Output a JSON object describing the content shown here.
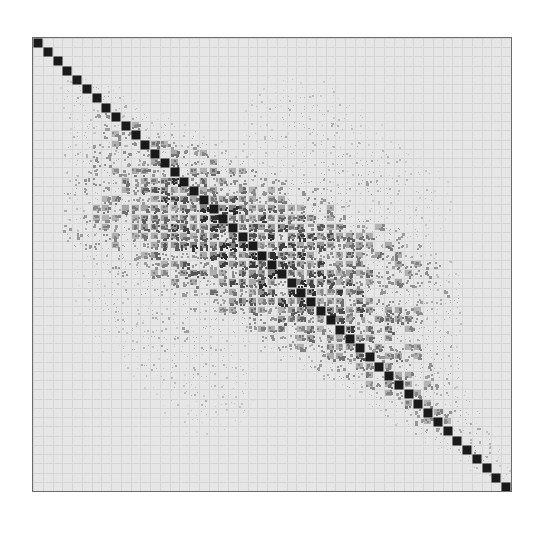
{
  "figure": {
    "title": "",
    "background_color": "#ffffff",
    "plot_background_color": "#e6e6e6",
    "frame_color": "#6b6b6b",
    "cell_dark_color": "#1a1a1a",
    "cell_mid_color": "#777777",
    "cell_light_color": "#b8b8b8",
    "gridline_color": "#d6d6d6"
  },
  "chart_data": {
    "type": "heatmap",
    "title": "",
    "xlabel": "",
    "ylabel": "",
    "grid": true,
    "legend": "none",
    "rows": 49,
    "cols": 49,
    "xticklabels": [],
    "yticklabels": [],
    "value_range": [
      0,
      1
    ],
    "colormap": "grayscale-dark-high",
    "diagonal_value": 1.0,
    "band_profile": [
      {
        "row": 0,
        "half_width": 0,
        "intensity": 0.0
      },
      {
        "row": 1,
        "half_width": 0,
        "intensity": 0.0
      },
      {
        "row": 2,
        "half_width": 0,
        "intensity": 0.0
      },
      {
        "row": 3,
        "half_width": 0,
        "intensity": 0.0
      },
      {
        "row": 4,
        "half_width": 1,
        "intensity": 0.14
      },
      {
        "row": 5,
        "half_width": 3,
        "intensity": 0.2
      },
      {
        "row": 6,
        "half_width": 4,
        "intensity": 0.24
      },
      {
        "row": 7,
        "half_width": 4,
        "intensity": 0.26
      },
      {
        "row": 8,
        "half_width": 5,
        "intensity": 0.28
      },
      {
        "row": 9,
        "half_width": 6,
        "intensity": 0.3
      },
      {
        "row": 10,
        "half_width": 7,
        "intensity": 0.32
      },
      {
        "row": 11,
        "half_width": 8,
        "intensity": 0.36
      },
      {
        "row": 12,
        "half_width": 9,
        "intensity": 0.4
      },
      {
        "row": 13,
        "half_width": 10,
        "intensity": 0.44
      },
      {
        "row": 14,
        "half_width": 11,
        "intensity": 0.48
      },
      {
        "row": 15,
        "half_width": 12,
        "intensity": 0.52
      },
      {
        "row": 16,
        "half_width": 13,
        "intensity": 0.56
      },
      {
        "row": 17,
        "half_width": 14,
        "intensity": 0.58
      },
      {
        "row": 18,
        "half_width": 15,
        "intensity": 0.6
      },
      {
        "row": 19,
        "half_width": 16,
        "intensity": 0.62
      },
      {
        "row": 20,
        "half_width": 17,
        "intensity": 0.64
      },
      {
        "row": 21,
        "half_width": 18,
        "intensity": 0.64
      },
      {
        "row": 22,
        "half_width": 18,
        "intensity": 0.64
      },
      {
        "row": 23,
        "half_width": 18,
        "intensity": 0.62
      },
      {
        "row": 24,
        "half_width": 18,
        "intensity": 0.62
      },
      {
        "row": 25,
        "half_width": 18,
        "intensity": 0.6
      },
      {
        "row": 26,
        "half_width": 17,
        "intensity": 0.6
      },
      {
        "row": 27,
        "half_width": 16,
        "intensity": 0.58
      },
      {
        "row": 28,
        "half_width": 15,
        "intensity": 0.56
      },
      {
        "row": 29,
        "half_width": 14,
        "intensity": 0.54
      },
      {
        "row": 30,
        "half_width": 13,
        "intensity": 0.52
      },
      {
        "row": 31,
        "half_width": 12,
        "intensity": 0.5
      },
      {
        "row": 32,
        "half_width": 11,
        "intensity": 0.48
      },
      {
        "row": 33,
        "half_width": 10,
        "intensity": 0.46
      },
      {
        "row": 34,
        "half_width": 9,
        "intensity": 0.44
      },
      {
        "row": 35,
        "half_width": 8,
        "intensity": 0.42
      },
      {
        "row": 36,
        "half_width": 7,
        "intensity": 0.4
      },
      {
        "row": 37,
        "half_width": 6,
        "intensity": 0.38
      },
      {
        "row": 38,
        "half_width": 6,
        "intensity": 0.36
      },
      {
        "row": 39,
        "half_width": 5,
        "intensity": 0.34
      },
      {
        "row": 40,
        "half_width": 5,
        "intensity": 0.32
      },
      {
        "row": 41,
        "half_width": 4,
        "intensity": 0.3
      },
      {
        "row": 42,
        "half_width": 4,
        "intensity": 0.28
      },
      {
        "row": 43,
        "half_width": 3,
        "intensity": 0.26
      },
      {
        "row": 44,
        "half_width": 3,
        "intensity": 0.24
      },
      {
        "row": 45,
        "half_width": 2,
        "intensity": 0.22
      },
      {
        "row": 46,
        "half_width": 2,
        "intensity": 0.2
      },
      {
        "row": 47,
        "half_width": 1,
        "intensity": 0.18
      },
      {
        "row": 48,
        "half_width": 0,
        "intensity": 0.0
      }
    ],
    "offdiagonal_clusters": [
      {
        "row_start": 4,
        "row_end": 16,
        "col_start": 21,
        "col_end": 33,
        "intensity": 0.22
      },
      {
        "row_start": 9,
        "row_end": 20,
        "col_start": 26,
        "col_end": 38,
        "intensity": 0.26
      },
      {
        "row_start": 13,
        "row_end": 22,
        "col_start": 32,
        "col_end": 42,
        "intensity": 0.2
      },
      {
        "row_start": 21,
        "row_end": 33,
        "col_start": 4,
        "col_end": 16,
        "intensity": 0.22
      },
      {
        "row_start": 26,
        "row_end": 38,
        "col_start": 9,
        "col_end": 20,
        "intensity": 0.26
      },
      {
        "row_start": 32,
        "row_end": 42,
        "col_start": 13,
        "col_end": 22,
        "intensity": 0.2
      }
    ]
  }
}
